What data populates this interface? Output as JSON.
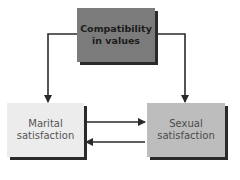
{
  "diagram": {
    "nodes": [
      {
        "id": "compatibility",
        "label": "Compatibility\nin values",
        "fill": "#7b7b7b",
        "text_color": "#1c1c1c",
        "bold": true
      },
      {
        "id": "marital",
        "label": "Marital\nsatisfaction",
        "fill": "#ececec",
        "text_color": "#555555",
        "bold": false
      },
      {
        "id": "sexual",
        "label": "Sexual\nsatisfaction",
        "fill": "#bdbdbd",
        "text_color": "#4a4a4a",
        "bold": false
      }
    ],
    "edges": [
      {
        "from": "compatibility",
        "to": "marital"
      },
      {
        "from": "compatibility",
        "to": "sexual"
      },
      {
        "from": "marital",
        "to": "sexual"
      },
      {
        "from": "sexual",
        "to": "marital"
      }
    ],
    "colors": {
      "line": "#2a2a2a",
      "shadow": "#2a2a2a"
    }
  }
}
